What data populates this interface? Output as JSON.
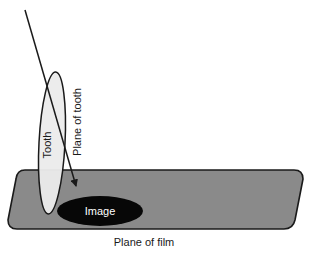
{
  "figure": {
    "labels": {
      "tooth": "Tooth",
      "plane_of_tooth": "Plane of tooth",
      "image": "Image",
      "plane_of_film": "Plane of film"
    },
    "colors": {
      "background": "#ffffff",
      "film_fill": "#8a8a8a",
      "film_stroke": "#1a1a1a",
      "tooth_fill": "#ebebeb",
      "tooth_stroke": "#1a1a1a",
      "image_fill": "#070707",
      "ray_stroke": "#1a1a1a",
      "text": "#1a1a1a",
      "text_on_image": "#ffffff"
    },
    "geometry": {
      "film_plane": {
        "shape": "rounded-parallelogram",
        "top_left_x": 16,
        "top_y": 170,
        "bottom_left_x": 8,
        "bottom_y": 229,
        "top_right_x": 303,
        "bottom_right_x": 295,
        "corner_radius": 9
      },
      "tooth_ellipse": {
        "center_x": 52,
        "center_y": 143,
        "radius_x": 13,
        "radius_y": 71,
        "rotation_deg": 3
      },
      "image_ellipse": {
        "center_x": 100,
        "center_y": 211,
        "radius_x": 43,
        "radius_y": 15
      },
      "ray_line": {
        "x1": 25,
        "y1": 10,
        "x2": 78,
        "y2": 191,
        "arrowhead": "filled-triangle-at-end"
      }
    },
    "label_placement": {
      "tooth": {
        "x": 51,
        "y": 145,
        "rotation_deg": -90
      },
      "plane_of_tooth": {
        "x": 81,
        "y": 122,
        "rotation_deg": -90
      },
      "image": {
        "x": 100,
        "y": 215,
        "rotation_deg": 0
      },
      "plane_of_film": {
        "x": 144,
        "y": 245,
        "rotation_deg": 0
      }
    }
  }
}
